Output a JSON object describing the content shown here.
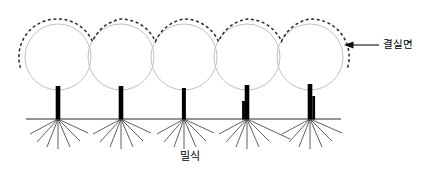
{
  "diagram": {
    "labels": {
      "fruiting_surface": "결실면",
      "dense_planting": "밀식"
    },
    "colors": {
      "canopy_stroke": "#b8b8b8",
      "dashed_outline": "#2b2b2b",
      "trunk": "#000000",
      "ground": "#2b2b2b",
      "root": "#2b2b2b",
      "text": "#000000",
      "background": "#ffffff"
    },
    "geometry": {
      "width": 435,
      "height": 174,
      "ground_y": 119,
      "ground_x_start": 26,
      "ground_x_end": 341,
      "circle_radius": 33,
      "circle_center_y": 57,
      "dashed_offset": 5,
      "trunk_width": 4.5,
      "trunk_top_y": 85
    },
    "trees": [
      {
        "id": "tree-1",
        "center_x": 58,
        "trunk_x": 58,
        "trunk_top_y": 86,
        "stub": "none"
      },
      {
        "id": "tree-2",
        "center_x": 121,
        "trunk_x": 121,
        "trunk_top_y": 86,
        "stub": "none"
      },
      {
        "id": "tree-3",
        "center_x": 184,
        "trunk_x": 184,
        "trunk_top_y": 88,
        "stub": "none"
      },
      {
        "id": "tree-4",
        "center_x": 247,
        "trunk_x": 247,
        "trunk_top_y": 85,
        "stub": "left"
      },
      {
        "id": "tree-5",
        "center_x": 310,
        "trunk_x": 310,
        "trunk_top_y": 84,
        "stub": "right"
      }
    ],
    "roots_per_tree": 7,
    "leader": {
      "arrow_tip_x": 345,
      "arrow_tail_x": 378,
      "arrow_y": 45,
      "direction": "left"
    }
  }
}
